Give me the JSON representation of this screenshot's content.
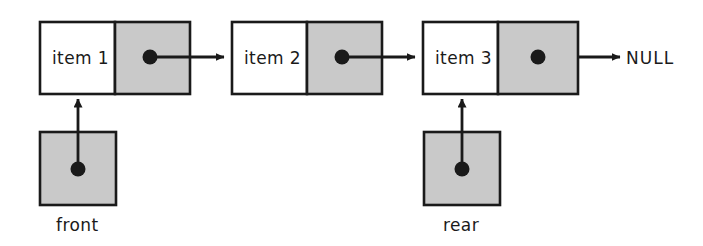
{
  "diagram": {
    "colors": {
      "background": "#ffffff",
      "box_fill_data": "#ffffff",
      "box_fill_pointer": "#c9c9c9",
      "stroke": "#1a1a1a",
      "text": "#1a1a1a"
    },
    "nodes": [
      {
        "id": "node-1",
        "data_label": "item 1",
        "pointer_dot": "filled-dot",
        "link_target": "node-2"
      },
      {
        "id": "node-2",
        "data_label": "item 2",
        "pointer_dot": "filled-dot",
        "link_target": "node-3"
      },
      {
        "id": "node-3",
        "data_label": "item 3",
        "pointer_dot": "filled-dot",
        "link_target": "null-terminator"
      }
    ],
    "terminator": {
      "id": "null-terminator",
      "label": "NULL"
    },
    "pointers": [
      {
        "id": "front-pointer",
        "label": "front",
        "dot": "filled-dot",
        "points_to": "node-1"
      },
      {
        "id": "rear-pointer",
        "label": "rear",
        "dot": "filled-dot",
        "points_to": "node-3"
      }
    ]
  }
}
